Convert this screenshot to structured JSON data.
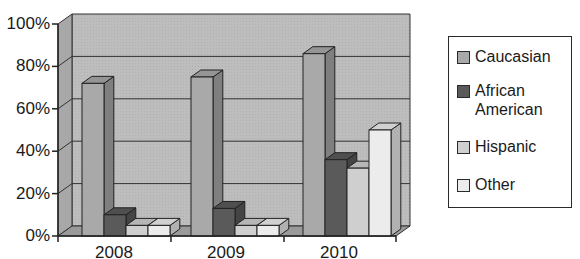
{
  "chart_data": {
    "type": "bar",
    "style": "3d-clustered-column",
    "title": "",
    "xlabel": "",
    "ylabel": "",
    "categories": [
      "2008",
      "2009",
      "2010"
    ],
    "series": [
      {
        "name": "Caucasian",
        "values": [
          72,
          75,
          86
        ],
        "color": "#a9a9a9"
      },
      {
        "name": "African American",
        "values": [
          10,
          13,
          36
        ],
        "color": "#5a5a5a"
      },
      {
        "name": "Hispanic",
        "values": [
          5,
          5,
          32
        ],
        "color": "#cfcfcf"
      },
      {
        "name": "Other",
        "values": [
          5,
          5,
          50
        ],
        "color": "#ececec"
      }
    ],
    "yticks": [
      "0%",
      "20%",
      "40%",
      "60%",
      "80%",
      "100%"
    ],
    "ylim": [
      0,
      100
    ],
    "grid": true,
    "legend_position": "right"
  },
  "legend": {
    "items": [
      {
        "label": "Caucasian",
        "color": "#a9a9a9"
      },
      {
        "label": "African\nAmerican",
        "color": "#5a5a5a"
      },
      {
        "label": "Hispanic",
        "color": "#cfcfcf"
      },
      {
        "label": "Other",
        "color": "#ececec"
      }
    ]
  },
  "axis": {
    "y_labels": [
      "100%",
      "80%",
      "60%",
      "40%",
      "20%",
      "0%"
    ],
    "x_labels": [
      "2008",
      "2009",
      "2010"
    ]
  }
}
